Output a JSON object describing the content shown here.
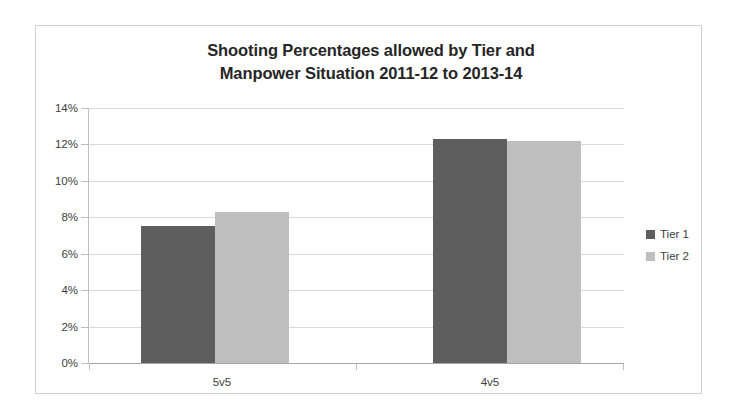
{
  "chart_data": {
    "type": "bar",
    "title": "Shooting Percentages allowed by Tier and Manpower Situation 2011-12 to 2013-14",
    "title_line1": "Shooting Percentages allowed by Tier and",
    "title_line2": "Manpower Situation 2011-12 to 2013-14",
    "xlabel": "",
    "ylabel": "",
    "categories": [
      "5v5",
      "4v5"
    ],
    "series": [
      {
        "name": "Tier 1",
        "values": [
          7.5,
          12.3
        ],
        "color": "#5e5e5e"
      },
      {
        "name": "Tier 2",
        "values": [
          8.3,
          12.2
        ],
        "color": "#bfbfbf"
      }
    ],
    "ylim": [
      0,
      14
    ],
    "ytick_step": 2,
    "ytick_labels": [
      "14%",
      "12%",
      "10%",
      "8%",
      "6%",
      "4%",
      "2%",
      "0%"
    ],
    "ytick_values": [
      14,
      12,
      10,
      8,
      6,
      4,
      2,
      0
    ],
    "grid": true,
    "legend_position": "right",
    "legend_entries": [
      "Tier 1",
      "Tier 2"
    ],
    "value_format": "percent"
  },
  "legend": {
    "items": [
      {
        "label": "Tier 1",
        "color": "#5e5e5e"
      },
      {
        "label": "Tier 2",
        "color": "#bfbfbf"
      }
    ]
  },
  "colors": {
    "tier1": "#5e5e5e",
    "tier2": "#bfbfbf",
    "gridline": "#d9d9d9",
    "axis": "#a6a6a6",
    "frame": "#d2d2d2",
    "text": "#404040",
    "title": "#262626"
  }
}
